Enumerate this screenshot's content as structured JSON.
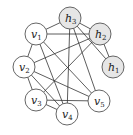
{
  "title": "",
  "colors": {
    "edge": "#333333",
    "node_stroke": "#555555",
    "plain_fill": "#ffffff",
    "hidden_fill": "#e6e6e6"
  },
  "nodes": [
    {
      "id": "v1",
      "base": "v",
      "sub": "1",
      "x": 36,
      "y": 34,
      "type": "plain"
    },
    {
      "id": "v2",
      "base": "v",
      "sub": "2",
      "x": 24,
      "y": 67,
      "type": "plain"
    },
    {
      "id": "v3",
      "base": "v",
      "sub": "3",
      "x": 36,
      "y": 100,
      "type": "plain"
    },
    {
      "id": "v4",
      "base": "v",
      "sub": "4",
      "x": 67,
      "y": 114,
      "type": "plain"
    },
    {
      "id": "v5",
      "base": "v",
      "sub": "5",
      "x": 99,
      "y": 101,
      "type": "plain"
    },
    {
      "id": "h1",
      "base": "h",
      "sub": "1",
      "x": 113,
      "y": 67,
      "type": "hidden"
    },
    {
      "id": "h2",
      "base": "h",
      "sub": "2",
      "x": 100,
      "y": 34,
      "type": "hidden"
    },
    {
      "id": "h3",
      "base": "h",
      "sub": "3",
      "x": 70,
      "y": 18,
      "type": "hidden"
    }
  ],
  "edges": [
    [
      "v1",
      "h3"
    ],
    [
      "v1",
      "h2"
    ],
    [
      "v1",
      "v2"
    ],
    [
      "v1",
      "v4"
    ],
    [
      "v1",
      "v5"
    ],
    [
      "h3",
      "h2"
    ],
    [
      "h3",
      "h1"
    ],
    [
      "h3",
      "v4"
    ],
    [
      "h3",
      "v5"
    ],
    [
      "h2",
      "h1"
    ],
    [
      "h2",
      "v2"
    ],
    [
      "h2",
      "v3"
    ],
    [
      "v2",
      "v3"
    ],
    [
      "v2",
      "v4"
    ],
    [
      "v2",
      "v5"
    ],
    [
      "v3",
      "v4"
    ],
    [
      "v3",
      "v5"
    ]
  ],
  "node_radius": 11
}
